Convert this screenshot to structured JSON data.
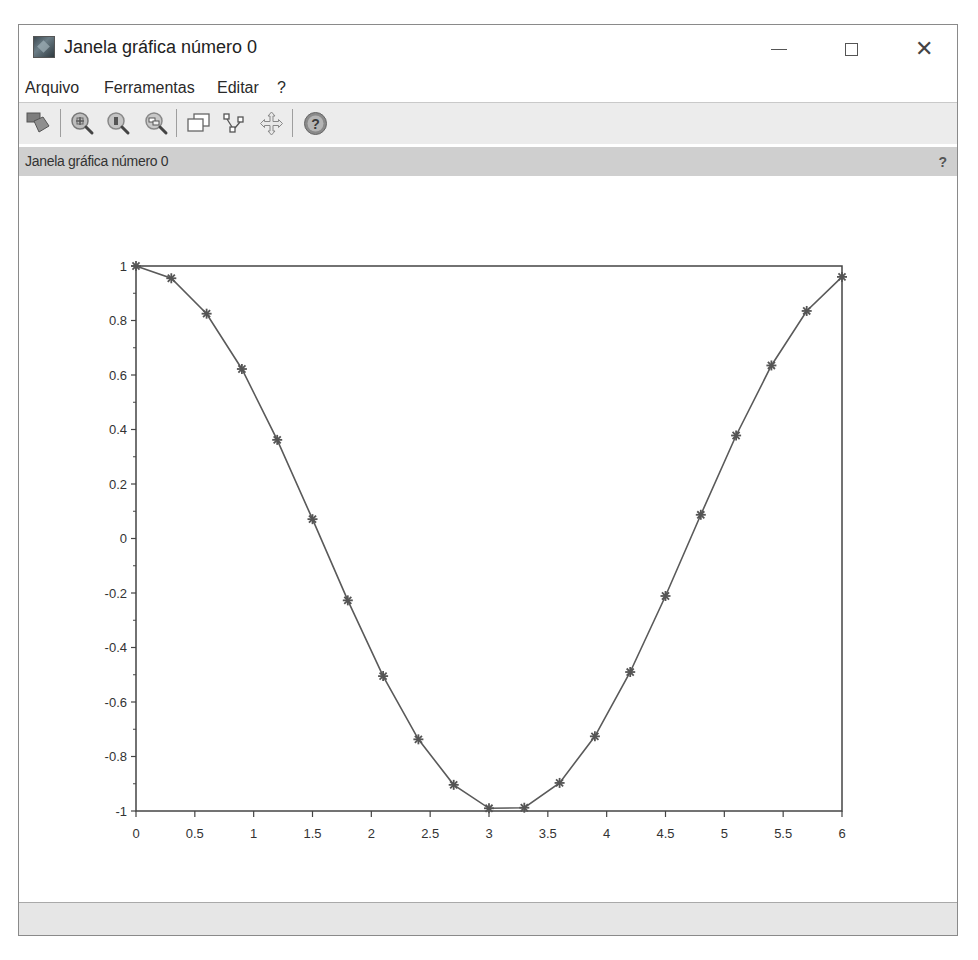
{
  "window": {
    "title": "Janela gráfica número 0",
    "controls": {
      "minimize": "minimize",
      "maximize": "maximize",
      "close": "close"
    }
  },
  "menubar": {
    "items": [
      {
        "label": "Arquivo"
      },
      {
        "label": "Ferramentas"
      },
      {
        "label": "Editar"
      },
      {
        "label": "?"
      }
    ]
  },
  "toolbar": {
    "icons": [
      "rotate-3d-icon",
      "zoom-in-icon",
      "zoom-original-icon",
      "zoom-area-icon",
      "windows-icon",
      "datatip-icon",
      "pan-icon",
      "help-icon"
    ]
  },
  "infobar": {
    "text": "Janela gráfica número 0",
    "help": "?"
  },
  "chart_data": {
    "type": "line",
    "title": "",
    "xlabel": "",
    "ylabel": "",
    "xlim": [
      0,
      6
    ],
    "ylim": [
      -1,
      1
    ],
    "grid": false,
    "legend": null,
    "marker": "star",
    "line_color": "#5a5a5a",
    "x_ticks": [
      "0",
      "0.5",
      "1",
      "1.5",
      "2",
      "2.5",
      "3",
      "3.5",
      "4",
      "4.5",
      "5",
      "5.5",
      "6"
    ],
    "y_ticks": [
      "-1",
      "-0.8",
      "-0.6",
      "-0.4",
      "-0.2",
      "0",
      "0.2",
      "0.4",
      "0.6",
      "0.8",
      "1"
    ],
    "series": [
      {
        "name": "cos(x)",
        "x": [
          0,
          0.3,
          0.6,
          0.9,
          1.2,
          1.5,
          1.8,
          2.1,
          2.4,
          2.7,
          3.0,
          3.3,
          3.6,
          3.9,
          4.2,
          4.5,
          4.8,
          5.1,
          5.4,
          5.7,
          6.0
        ],
        "values": [
          1.0,
          0.955,
          0.825,
          0.622,
          0.362,
          0.071,
          -0.227,
          -0.505,
          -0.737,
          -0.904,
          -0.99,
          -0.988,
          -0.897,
          -0.726,
          -0.49,
          -0.211,
          0.087,
          0.378,
          0.635,
          0.835,
          0.96
        ]
      }
    ]
  }
}
